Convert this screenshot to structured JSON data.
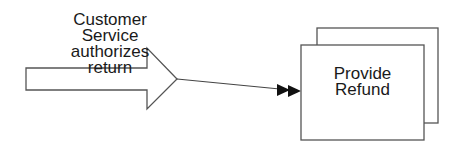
{
  "diagram": {
    "type": "process-flow",
    "event": {
      "shape": "block-arrow",
      "label_lines": [
        "Customer",
        "Service",
        "authorizes",
        "return"
      ]
    },
    "connector": {
      "style": "line-with-double-arrowhead",
      "from": "event",
      "to": "process"
    },
    "process": {
      "shape": "stacked-rectangles",
      "label_lines": [
        "Provide",
        "Refund"
      ]
    },
    "colors": {
      "stroke": "#555555",
      "fill": "#ffffff",
      "text": "#1a1a1a",
      "arrowhead": "#111111"
    }
  }
}
